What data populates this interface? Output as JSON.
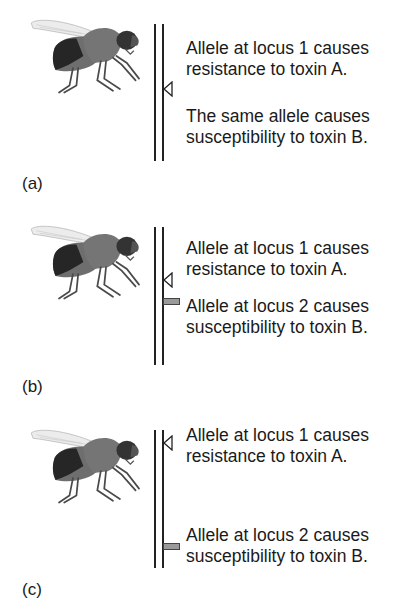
{
  "figure": {
    "colors": {
      "line": "#222222",
      "locus2_marker": "#9a9a9a",
      "fly_body": "#707070",
      "fly_abdomen_dark": "#2a2a2a",
      "fly_head": "#3a3a3a",
      "fly_wing": "#e8e8e8"
    },
    "panels": [
      {
        "id": "a",
        "label": "(a)",
        "texts": [
          {
            "line1": "Allele at locus 1 causes",
            "line2": "resistance to toxin A."
          },
          {
            "line1": "The same allele causes",
            "line2": "susceptibility to toxin B."
          }
        ],
        "markers": [
          "locus-1-triangle"
        ]
      },
      {
        "id": "b",
        "label": "(b)",
        "texts": [
          {
            "line1": "Allele at locus 1 causes",
            "line2": "resistance to toxin A."
          },
          {
            "line1": "Allele at locus 2 causes",
            "line2": "susceptibility to toxin B."
          }
        ],
        "markers": [
          "locus-1-triangle",
          "locus-2-bar"
        ]
      },
      {
        "id": "c",
        "label": "(c)",
        "texts": [
          {
            "line1": "Allele at locus 1 causes",
            "line2": "resistance to toxin A."
          },
          {
            "line1": "Allele at locus 2 causes",
            "line2": "susceptibility to toxin B."
          }
        ],
        "markers": [
          "locus-1-triangle",
          "locus-2-bar"
        ]
      }
    ]
  }
}
